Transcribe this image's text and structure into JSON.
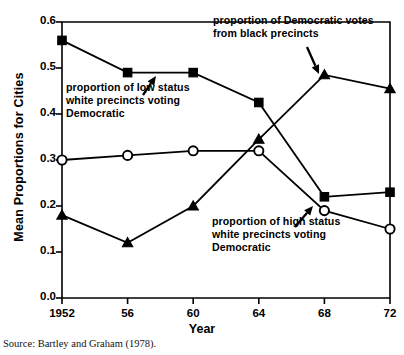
{
  "figure": {
    "xlabel": "Year",
    "ylabel": "Mean Proportions for Cities",
    "source": "Source: Bartley and Graham (1978)."
  },
  "annotations": {
    "low_status": "proportion of low status\nwhite precincts voting\nDemocratic",
    "low_status_l1": "proportion of low status",
    "low_status_l2": "white precincts voting",
    "low_status_l3": "Democratic",
    "black_precincts_l1": "proportion of Democratic votes",
    "black_precincts_l2": "from black precincts",
    "high_status_l1": "proportion of high status",
    "high_status_l2": "white precincts voting",
    "high_status_l3": "Democratic"
  },
  "chart_data": {
    "type": "line",
    "title": "",
    "xlabel": "Year",
    "ylabel": "Mean Proportions for Cities",
    "categories": [
      "1952",
      "56",
      "60",
      "64",
      "68",
      "72"
    ],
    "x": [
      1952,
      1956,
      1960,
      1964,
      1968,
      1972
    ],
    "xtick_labels": [
      "1952",
      "56",
      "60",
      "64",
      "68",
      "72"
    ],
    "ytick_labels": [
      "0.0",
      "0.1",
      "0.2",
      "0.3",
      "0.4",
      "0.5",
      "0.6"
    ],
    "yticks": [
      0.0,
      0.1,
      0.2,
      0.3,
      0.4,
      0.5,
      0.6
    ],
    "ylim": [
      0.0,
      0.6
    ],
    "xlim": [
      1952,
      1972
    ],
    "grid": false,
    "legend": "annotations",
    "series": [
      {
        "name": "proportion of low status white precincts voting Democratic",
        "marker": "filled-square",
        "color": "#000000",
        "values": [
          0.56,
          0.49,
          0.49,
          0.425,
          0.22,
          0.23
        ]
      },
      {
        "name": "proportion of high status white precincts voting Democratic",
        "marker": "open-circle",
        "color": "#000000",
        "values": [
          0.3,
          0.31,
          0.32,
          0.32,
          0.19,
          0.15
        ]
      },
      {
        "name": "proportion of Democratic votes from black precincts",
        "marker": "filled-triangle",
        "color": "#000000",
        "values": [
          0.18,
          0.12,
          0.2,
          0.345,
          0.485,
          0.455
        ]
      }
    ]
  }
}
